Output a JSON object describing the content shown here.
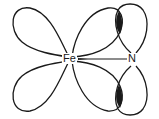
{
  "diagram": {
    "atoms": [
      {
        "id": "fe",
        "label": "Fe"
      },
      {
        "id": "n",
        "label": "N"
      }
    ],
    "bond": {
      "from": "Fe",
      "to": "N",
      "style": "wedge-line"
    },
    "colors": {
      "stroke": "#1a1a1a",
      "overlap_fill": "#1a1a1a",
      "background": "#ffffff"
    }
  }
}
